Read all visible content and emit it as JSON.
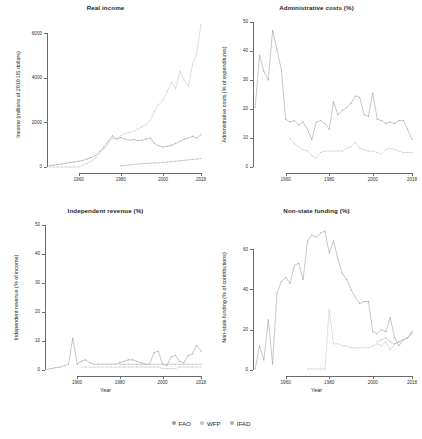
{
  "figure": {
    "width": 422,
    "height": 439,
    "background": "#ffffff"
  },
  "legend": {
    "position": "bottom-center",
    "items": [
      {
        "label": "FAO",
        "color": "#9a9a9a",
        "marker": "dot"
      },
      {
        "label": "WFP",
        "color": "#c4c4c4",
        "marker": "dot"
      },
      {
        "label": "IFAD",
        "color": "#b0b0b0",
        "marker": "dot"
      }
    ]
  },
  "chart_data": [
    {
      "type": "line",
      "title": "Real income",
      "xlabel": "",
      "ylabel": "Income (millions of 2010 US dollars)",
      "xlim": [
        1945,
        2018
      ],
      "ylim": [
        0,
        6500
      ],
      "xticks": [
        1960,
        1980,
        2000,
        2018
      ],
      "yticks": [
        0,
        2000,
        4000,
        6000
      ],
      "grid": false,
      "x": [
        1946,
        1948,
        1950,
        1952,
        1954,
        1956,
        1958,
        1960,
        1962,
        1964,
        1966,
        1968,
        1970,
        1972,
        1974,
        1976,
        1978,
        1980,
        1982,
        1984,
        1986,
        1988,
        1990,
        1992,
        1994,
        1996,
        1998,
        2000,
        2002,
        2004,
        2006,
        2008,
        2010,
        2012,
        2014,
        2016,
        2018
      ],
      "series": [
        {
          "name": "FAO",
          "color": "#9a9a9a",
          "values": [
            60,
            80,
            110,
            140,
            170,
            200,
            230,
            260,
            300,
            360,
            430,
            520,
            700,
            900,
            1150,
            1400,
            1250,
            1320,
            1250,
            1200,
            1230,
            1180,
            1200,
            1250,
            1300,
            1050,
            950,
            900,
            930,
            980,
            1050,
            1150,
            1250,
            1300,
            1380,
            1300,
            1450
          ]
        },
        {
          "name": "WFP",
          "color": "#c4c4c4",
          "values": [
            0,
            0,
            0,
            0,
            0,
            0,
            0,
            0,
            80,
            160,
            260,
            400,
            600,
            800,
            1050,
            1300,
            1250,
            1400,
            1500,
            1550,
            1600,
            1700,
            1800,
            1900,
            2100,
            2500,
            2800,
            3000,
            3400,
            3800,
            3500,
            4300,
            3900,
            3600,
            4600,
            5100,
            6400
          ]
        },
        {
          "name": "IFAD",
          "color": "#b0b0b0",
          "values": [
            null,
            null,
            null,
            null,
            null,
            null,
            null,
            null,
            null,
            null,
            null,
            null,
            null,
            null,
            null,
            null,
            null,
            50,
            70,
            90,
            110,
            130,
            150,
            160,
            170,
            180,
            190,
            200,
            220,
            240,
            260,
            280,
            300,
            320,
            340,
            360,
            380
          ]
        }
      ]
    },
    {
      "type": "line",
      "title": "Administrative costs (%)",
      "xlabel": "",
      "ylabel": "Administrative costs (% of expenditures)",
      "xlim": [
        1945,
        2018
      ],
      "ylim": [
        0,
        50
      ],
      "xticks": [
        1960,
        1980,
        2000,
        2018
      ],
      "yticks": [
        0,
        10,
        20,
        30,
        40,
        50
      ],
      "grid": false,
      "x": [
        1946,
        1948,
        1950,
        1952,
        1954,
        1956,
        1958,
        1960,
        1962,
        1964,
        1966,
        1968,
        1970,
        1972,
        1974,
        1976,
        1978,
        1980,
        1982,
        1984,
        1986,
        1988,
        1990,
        1992,
        1994,
        1996,
        1998,
        2000,
        2002,
        2004,
        2006,
        2008,
        2010,
        2012,
        2014,
        2016,
        2018
      ],
      "series": [
        {
          "name": "FAO",
          "color": "#9a9a9a",
          "values": [
            20.5,
            38.5,
            33.0,
            30.0,
            47.0,
            40.5,
            33.5,
            16.5,
            15.5,
            16.0,
            14.5,
            15.5,
            13.0,
            9.5,
            15.5,
            16.0,
            15.0,
            13.0,
            22.5,
            18.0,
            19.5,
            20.5,
            22.0,
            24.5,
            24.0,
            18.0,
            17.5,
            25.5,
            16.5,
            16.0,
            15.0,
            15.5,
            15.0,
            16.0,
            16.0,
            13.0,
            9.5
          ]
        },
        {
          "name": "WFP",
          "color": "#c4c4c4",
          "values": [
            null,
            null,
            null,
            null,
            null,
            null,
            null,
            null,
            10.0,
            8.0,
            7.0,
            6.0,
            5.5,
            4.0,
            3.0,
            5.0,
            5.5,
            5.5,
            5.5,
            5.5,
            5.5,
            6.5,
            7.0,
            8.5,
            6.5,
            6.0,
            5.5,
            5.5,
            5.0,
            4.5,
            6.0,
            6.5,
            6.0,
            5.5,
            5.0,
            5.0,
            5.0
          ]
        },
        {
          "name": "IFAD",
          "color": "#b0b0b0",
          "values": [
            null,
            null,
            null,
            null,
            null,
            null,
            null,
            null,
            null,
            null,
            null,
            null,
            null,
            null,
            null,
            null,
            null,
            null,
            null,
            null,
            null,
            null,
            null,
            null,
            null,
            null,
            null,
            null,
            null,
            null,
            null,
            null,
            null,
            null,
            null,
            null,
            null
          ]
        }
      ]
    },
    {
      "type": "line",
      "title": "Independent revenue (%)",
      "xlabel": "Year",
      "ylabel": "Independent revenue (% of income)",
      "xlim": [
        1945,
        2018
      ],
      "ylim": [
        0,
        50
      ],
      "xticks": [
        1960,
        1980,
        2000,
        2018
      ],
      "yticks": [
        0,
        10,
        20,
        30,
        40,
        50
      ],
      "grid": false,
      "x": [
        1946,
        1948,
        1950,
        1952,
        1954,
        1956,
        1958,
        1960,
        1962,
        1964,
        1966,
        1968,
        1970,
        1972,
        1974,
        1976,
        1978,
        1980,
        1982,
        1984,
        1986,
        1988,
        1990,
        1992,
        1994,
        1996,
        1998,
        2000,
        2002,
        2004,
        2006,
        2008,
        2010,
        2012,
        2014,
        2016,
        2018
      ],
      "series": [
        {
          "name": "FAO",
          "color": "#9a9a9a",
          "values": [
            0.3,
            0.5,
            0.8,
            1.0,
            1.5,
            2.0,
            11.0,
            2.0,
            3.0,
            3.5,
            2.5,
            2.0,
            2.0,
            2.0,
            2.0,
            2.0,
            2.0,
            2.5,
            3.0,
            3.5,
            3.5,
            3.0,
            2.5,
            2.0,
            2.0,
            6.0,
            6.5,
            2.0,
            1.5,
            4.5,
            5.0,
            3.0,
            2.5,
            5.0,
            5.5,
            8.5,
            6.5
          ]
        },
        {
          "name": "WFP",
          "color": "#c4c4c4",
          "values": [
            null,
            null,
            null,
            null,
            null,
            null,
            null,
            null,
            1.0,
            1.0,
            1.0,
            1.0,
            1.0,
            1.0,
            1.0,
            1.0,
            1.0,
            1.0,
            1.0,
            1.0,
            1.0,
            1.0,
            1.0,
            1.0,
            1.0,
            1.0,
            1.0,
            0.5,
            0.5,
            0.5,
            0.5,
            1.0,
            1.0,
            1.0,
            1.0,
            1.0,
            1.0
          ]
        },
        {
          "name": "IFAD",
          "color": "#b0b0b0",
          "values": [
            null,
            null,
            null,
            null,
            null,
            null,
            null,
            null,
            null,
            null,
            null,
            null,
            null,
            null,
            null,
            null,
            null,
            2.0,
            2.0,
            2.0,
            2.0,
            2.0,
            2.0,
            2.0,
            2.0,
            2.0,
            2.0,
            2.0,
            2.0,
            2.0,
            2.0,
            2.0,
            2.0,
            2.0,
            2.0,
            2.0,
            2.0
          ]
        }
      ]
    },
    {
      "type": "line",
      "title": "Non-state funding (%)",
      "xlabel": "Year",
      "ylabel": "Non-state funding (% of contributions)",
      "xlim": [
        1945,
        2018
      ],
      "ylim": [
        0,
        72
      ],
      "xticks": [
        1960,
        1980,
        2000,
        2018
      ],
      "yticks": [
        0,
        20,
        40,
        60
      ],
      "grid": false,
      "x": [
        1946,
        1948,
        1950,
        1952,
        1954,
        1956,
        1958,
        1960,
        1962,
        1964,
        1966,
        1968,
        1970,
        1972,
        1974,
        1976,
        1978,
        1980,
        1982,
        1984,
        1986,
        1988,
        1990,
        1992,
        1994,
        1996,
        1998,
        2000,
        2002,
        2004,
        2006,
        2008,
        2010,
        2012,
        2014,
        2016,
        2018
      ],
      "series": [
        {
          "name": "FAO",
          "color": "#9a9a9a",
          "values": [
            0.5,
            12.0,
            5.0,
            25.0,
            3.0,
            38.0,
            44.0,
            46.0,
            43.0,
            52.0,
            53.0,
            45.0,
            64.0,
            67.0,
            66.0,
            68.0,
            69.0,
            58.0,
            64.0,
            55.0,
            48.0,
            45.0,
            40.0,
            36.0,
            33.0,
            34.0,
            34.0,
            19.0,
            18.0,
            20.0,
            19.0,
            26.0,
            16.0,
            12.0,
            15.0,
            16.0,
            19.0
          ]
        },
        {
          "name": "WFP",
          "color": "#c4c4c4",
          "values": [
            null,
            null,
            null,
            null,
            null,
            null,
            null,
            null,
            null,
            null,
            null,
            null,
            0.5,
            0.5,
            0.5,
            0.5,
            0.5,
            30.0,
            13.0,
            13.0,
            12.0,
            12.0,
            11.0,
            11.0,
            11.0,
            11.0,
            11.0,
            12.0,
            13.0,
            12.0,
            14.0,
            10.0,
            13.0,
            14.0,
            15.0,
            16.0,
            19.0
          ]
        },
        {
          "name": "IFAD",
          "color": "#b0b0b0",
          "values": [
            null,
            null,
            null,
            null,
            null,
            null,
            null,
            null,
            null,
            null,
            null,
            null,
            null,
            null,
            null,
            null,
            null,
            null,
            null,
            null,
            null,
            null,
            null,
            null,
            null,
            null,
            null,
            null,
            14.0,
            15.0,
            16.0,
            14.0,
            13.0,
            14.0,
            15.0,
            16.0,
            18.0
          ]
        }
      ]
    }
  ]
}
